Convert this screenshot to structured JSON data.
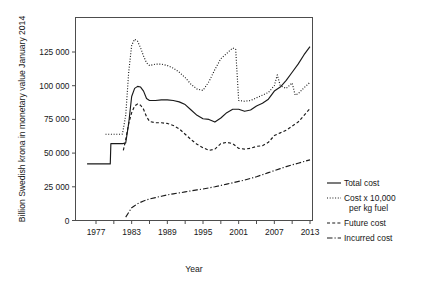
{
  "chart_data": {
    "type": "line",
    "title": "",
    "xlabel": "Year",
    "ylabel": "Billion Swedish krona in monetary value January 2014",
    "xlim": [
      1974,
      2014.5
    ],
    "ylim": [
      0,
      140000
    ],
    "grid": false,
    "legend_position": "right",
    "x_ticks_major": [
      1977,
      1983,
      1989,
      1995,
      2001,
      2007,
      2013
    ],
    "x_tick_labels": [
      "1977",
      "1983",
      "1989",
      "1995",
      "2001",
      "2007",
      "2013"
    ],
    "x_ticks_minor": [
      1980,
      1986,
      1992,
      1998,
      2004,
      2010
    ],
    "y_ticks": [
      0,
      25000,
      50000,
      75000,
      100000,
      125000
    ],
    "y_tick_labels": [
      "0",
      "25 000",
      "50 000",
      "75 000",
      "100 000",
      "125 000"
    ],
    "series": [
      {
        "name": "Total cost",
        "style": "solid",
        "x": [
          1975.5,
          1976.0,
          1976.5,
          1977.0,
          1977.5,
          1978.0,
          1978.5,
          1979.0,
          1979.4,
          1979.5,
          1980.0,
          1980.5,
          1981.0,
          1981.4,
          1981.5,
          1982.0,
          1982.5,
          1983.0,
          1983.5,
          1984.0,
          1984.5,
          1985.0,
          1985.5,
          1986.0,
          1986.5,
          1987.0,
          1988.0,
          1989.0,
          1990.0,
          1991.0,
          1992.0,
          1993.0,
          1994.0,
          1995.0,
          1996.0,
          1997.0,
          1998.0,
          1999.0,
          2000.0,
          2001.0,
          2002.0,
          2003.0,
          2004.0,
          2005.0,
          2006.0,
          2007.0,
          2008.0,
          2009.0,
          2010.0,
          2011.0,
          2012.0,
          2013.0
        ],
        "y": [
          42000,
          42000,
          42000,
          42000,
          42000,
          42000,
          42000,
          42000,
          42000,
          57000,
          57000,
          57000,
          57000,
          57000,
          57000,
          57500,
          72000,
          92000,
          98000,
          99500,
          99000,
          96000,
          90500,
          89000,
          89000,
          89000,
          89500,
          89500,
          89000,
          88000,
          86000,
          82000,
          78000,
          75500,
          75000,
          73000,
          76000,
          80000,
          82500,
          82500,
          81000,
          82000,
          85000,
          87000,
          90000,
          96000,
          99000,
          104000,
          110000,
          116000,
          123000,
          129000
        ]
      },
      {
        "name": "Cost x 10,000 per kg fuel",
        "style": "dotted",
        "x": [
          1978.6,
          1979.0,
          1979.5,
          1980.0,
          1980.5,
          1981.0,
          1981.4,
          1981.5,
          1982.0,
          1982.5,
          1983.0,
          1983.5,
          1984.0,
          1984.5,
          1985.0,
          1985.5,
          1986.0,
          1986.5,
          1987.0,
          1988.0,
          1989.0,
          1990.0,
          1991.0,
          1992.0,
          1993.0,
          1994.0,
          1995.0,
          1996.0,
          1997.0,
          1998.0,
          1999.0,
          2000.0,
          2000.5,
          2001.0,
          2002.0,
          2003.0,
          2004.0,
          2005.0,
          2006.0,
          2007.0,
          2007.5,
          2008.0,
          2009.0,
          2010.0,
          2010.5,
          2011.0,
          2012.0,
          2013.0
        ],
        "y": [
          64000,
          64000,
          64000,
          64000,
          64000,
          64000,
          64000,
          65500,
          78000,
          110000,
          130000,
          134500,
          133000,
          128000,
          122000,
          117000,
          115000,
          115500,
          116000,
          116000,
          115000,
          113000,
          110000,
          106000,
          101000,
          97500,
          96500,
          103000,
          112000,
          120000,
          124000,
          128000,
          127000,
          89000,
          88500,
          89000,
          91000,
          93000,
          95000,
          100000,
          108000,
          100000,
          98000,
          102000,
          93000,
          94000,
          98500,
          102500
        ]
      },
      {
        "name": "Future cost",
        "style": "dashed",
        "x": [
          1981.6,
          1982.0,
          1982.5,
          1983.0,
          1983.5,
          1984.0,
          1984.5,
          1985.0,
          1985.5,
          1986.0,
          1987.0,
          1988.0,
          1989.0,
          1990.0,
          1991.0,
          1992.0,
          1993.0,
          1994.0,
          1995.0,
          1996.0,
          1997.0,
          1998.0,
          1999.0,
          2000.0,
          2001.0,
          2002.0,
          2003.0,
          2004.0,
          2005.0,
          2006.0,
          2007.0,
          2008.0,
          2009.0,
          2010.0,
          2011.0,
          2012.0,
          2013.0
        ],
        "y": [
          52000,
          60000,
          72000,
          80000,
          85000,
          86500,
          85500,
          82500,
          77000,
          73500,
          72500,
          72500,
          72000,
          70500,
          68000,
          64000,
          60000,
          56500,
          54000,
          52000,
          53000,
          57000,
          58000,
          57000,
          53500,
          53000,
          53500,
          55000,
          55500,
          58000,
          63000,
          65000,
          67000,
          70000,
          73000,
          78000,
          83000
        ]
      },
      {
        "name": "Incurred cost",
        "style": "dashdot",
        "x": [
          1982.0,
          1982.5,
          1983.0,
          1983.5,
          1984.0,
          1985.0,
          1986.0,
          1987.0,
          1988.0,
          1989.0,
          1990.0,
          1991.0,
          1992.0,
          1993.0,
          1994.0,
          1995.0,
          1996.0,
          1997.0,
          1998.0,
          1999.0,
          2000.0,
          2001.0,
          2002.0,
          2003.0,
          2004.0,
          2005.0,
          2006.0,
          2007.0,
          2008.0,
          2009.0,
          2010.0,
          2011.0,
          2012.0,
          2013.0
        ],
        "y": [
          2500,
          6000,
          9500,
          11000,
          12500,
          14500,
          16000,
          17000,
          18000,
          19000,
          19800,
          20500,
          21200,
          22000,
          22700,
          23400,
          24200,
          25000,
          26000,
          27000,
          28000,
          29000,
          30000,
          31200,
          32500,
          34000,
          35500,
          37000,
          38500,
          40000,
          41300,
          42500,
          43800,
          45000
        ]
      }
    ]
  },
  "legend": {
    "items": [
      {
        "label": "Total cost",
        "style": "solid"
      },
      {
        "label": "Cost x 10,000",
        "label2": "per kg fuel",
        "style": "dotted"
      },
      {
        "label": "Future cost",
        "style": "dashed"
      },
      {
        "label": "Incurred cost",
        "style": "dashdot"
      }
    ]
  },
  "axes": {
    "x_title": "Year",
    "y_title": "Billion Swedish krona in monetary value January 2014"
  }
}
